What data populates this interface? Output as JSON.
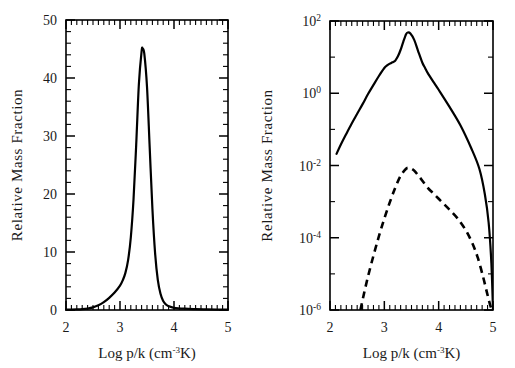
{
  "figure": {
    "background_color": "#ffffff",
    "line_color": "#000000",
    "text_color": "#1a1a1a",
    "panel_count": 2
  },
  "panels": {
    "left": {
      "name": "linear-panel",
      "ylabel": "Relative Mass Fraction",
      "xlabel_main": "Log p/k",
      "xlabel_unit_open": "(cm",
      "xlabel_unit_exp": "-3",
      "xlabel_unit_close": "K)",
      "xlabel_full": "Log p/k (cm-3K)",
      "x_ticks": [
        "2",
        "3",
        "4",
        "5"
      ],
      "y_ticks": [
        "0",
        "10",
        "20",
        "30",
        "40",
        "50"
      ]
    },
    "right": {
      "name": "log-panel",
      "ylabel": "Relative Mass Fraction",
      "xlabel_main": "Log p/k",
      "xlabel_unit_open": "(cm",
      "xlabel_unit_exp": "-3",
      "xlabel_unit_close": "K)",
      "xlabel_full": "Log p/k (cm-3K)",
      "x_ticks": [
        "2",
        "3",
        "4",
        "5"
      ],
      "y_ticks": [
        {
          "mantissa": "10",
          "exponent": "2"
        },
        {
          "mantissa": "10",
          "exponent": "0"
        },
        {
          "mantissa": "10",
          "exponent": "-2"
        },
        {
          "mantissa": "10",
          "exponent": "-4"
        },
        {
          "mantissa": "10",
          "exponent": "-6"
        }
      ]
    }
  },
  "chart_data": [
    {
      "type": "line",
      "panel": "left",
      "title": "",
      "xlabel": "Log p/k (cm^-3 K)",
      "ylabel": "Relative Mass Fraction",
      "xlim": [
        2,
        5
      ],
      "ylim": [
        0,
        50
      ],
      "yscale": "linear",
      "xscale": "linear",
      "grid": false,
      "legend": "none",
      "xticks": [
        2,
        3,
        4,
        5
      ],
      "yticks": [
        0,
        10,
        20,
        30,
        40,
        50
      ],
      "minor_ticks": true,
      "tick_direction": "in",
      "series": [
        {
          "name": "mass fraction distribution",
          "style": "solid",
          "linewidth": 2.2,
          "color": "#000000",
          "x": [
            2.0,
            2.1,
            2.2,
            2.3,
            2.4,
            2.5,
            2.6,
            2.7,
            2.8,
            2.9,
            3.0,
            3.05,
            3.1,
            3.15,
            3.2,
            3.25,
            3.3,
            3.35,
            3.4,
            3.42,
            3.45,
            3.5,
            3.55,
            3.6,
            3.65,
            3.7,
            3.75,
            3.8,
            3.85,
            3.9,
            4.0,
            4.2,
            4.4,
            4.6,
            4.8,
            5.0
          ],
          "y": [
            0.05,
            0.07,
            0.1,
            0.15,
            0.25,
            0.45,
            0.8,
            1.35,
            2.1,
            3.0,
            4.2,
            5.1,
            6.4,
            8.6,
            12.5,
            19.0,
            28.5,
            39.0,
            44.6,
            45.1,
            44.2,
            38.5,
            28.0,
            17.5,
            9.8,
            5.2,
            2.8,
            1.55,
            0.95,
            0.65,
            0.38,
            0.22,
            0.15,
            0.11,
            0.08,
            0.06
          ]
        }
      ]
    },
    {
      "type": "line",
      "panel": "right",
      "title": "",
      "xlabel": "Log p/k (cm^-3 K)",
      "ylabel": "Relative Mass Fraction",
      "xlim": [
        2,
        5
      ],
      "ylim": [
        1e-06,
        100
      ],
      "yscale": "log",
      "xscale": "linear",
      "grid": false,
      "legend": "none",
      "xticks": [
        2,
        3,
        4,
        5
      ],
      "yticks": [
        1e-06,
        0.0001,
        0.01,
        1,
        100
      ],
      "minor_ticks": true,
      "tick_direction": "in",
      "series": [
        {
          "name": "total mass fraction",
          "style": "solid",
          "linewidth": 2.2,
          "color": "#000000",
          "x": [
            2.12,
            2.2,
            2.3,
            2.4,
            2.5,
            2.6,
            2.7,
            2.8,
            2.9,
            3.0,
            3.05,
            3.1,
            3.15,
            3.2,
            3.25,
            3.3,
            3.35,
            3.4,
            3.43,
            3.48,
            3.55,
            3.62,
            3.7,
            3.75,
            3.8,
            3.9,
            4.0,
            4.2,
            4.4,
            4.6,
            4.75,
            4.85,
            4.92,
            4.97,
            5.0
          ],
          "y": [
            0.021,
            0.038,
            0.075,
            0.145,
            0.27,
            0.5,
            0.95,
            1.7,
            3.0,
            5.0,
            5.9,
            6.6,
            7.2,
            8.0,
            10.5,
            16.0,
            27.0,
            43.0,
            48.0,
            45.0,
            30.0,
            15.0,
            7.0,
            5.0,
            3.6,
            2.1,
            1.25,
            0.42,
            0.13,
            0.03,
            0.008,
            0.0016,
            0.00026,
            2e-05,
            1e-06
          ]
        },
        {
          "name": "secondary mass fraction",
          "style": "dashed",
          "linewidth": 2.6,
          "dasharray": "7,5",
          "color": "#000000",
          "x": [
            2.56,
            2.62,
            2.7,
            2.8,
            2.9,
            3.0,
            3.1,
            3.2,
            3.3,
            3.4,
            3.45,
            3.5,
            3.55,
            3.62,
            3.7,
            3.8,
            3.9,
            4.0,
            4.1,
            4.2,
            4.35,
            4.5,
            4.62,
            4.72,
            4.82,
            4.9,
            4.96,
            5.0
          ],
          "y": [
            1e-06,
            2.6e-06,
            8.5e-06,
            3.2e-05,
            0.00011,
            0.00034,
            0.00095,
            0.0024,
            0.0052,
            0.0081,
            0.0086,
            0.0082,
            0.0072,
            0.0054,
            0.0038,
            0.0024,
            0.0017,
            0.0012,
            0.00085,
            0.0006,
            0.00034,
            0.00016,
            7e-05,
            2.8e-05,
            8e-06,
            2.6e-06,
            1.2e-06,
            1e-06
          ]
        }
      ]
    }
  ]
}
